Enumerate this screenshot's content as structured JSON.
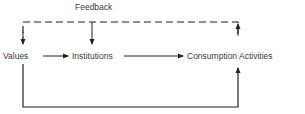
{
  "diagram": {
    "feedback_label": "Feedback",
    "nodes": [
      {
        "id": "values",
        "label": "Values"
      },
      {
        "id": "institutions",
        "label": "Institutions"
      },
      {
        "id": "consumption",
        "label": "Consumption Activities"
      }
    ],
    "edges": [
      {
        "from": "values",
        "to": "institutions",
        "style": "solid"
      },
      {
        "from": "institutions",
        "to": "consumption",
        "style": "solid"
      },
      {
        "from": "values",
        "to": "consumption",
        "style": "solid",
        "route": "below"
      },
      {
        "from": "consumption",
        "to": "values",
        "style": "dashed",
        "label": "Feedback",
        "route": "above"
      },
      {
        "from": "consumption",
        "to": "institutions",
        "style": "dashed",
        "label": "Feedback",
        "route": "above"
      }
    ]
  }
}
